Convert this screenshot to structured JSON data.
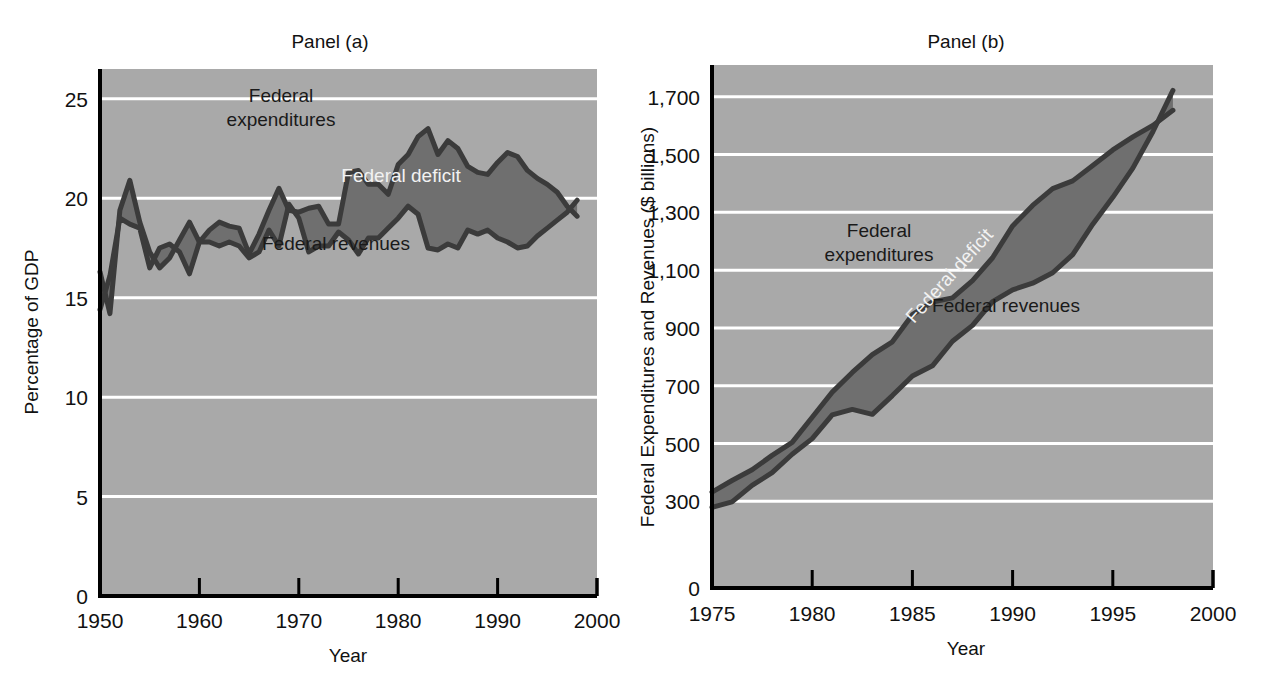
{
  "figure": {
    "background_color": "#ffffff",
    "plot_background_color": "#a9a9a9",
    "gridline_color": "#ffffff",
    "deficit_fill_color": "#6f6f6f",
    "line_color": "#3b3b3b"
  },
  "chart_data": [
    {
      "id": "panel_a",
      "type": "area",
      "title": "Panel (a)",
      "xlabel": "Year",
      "ylabel": "Percentage of GDP",
      "xlim": [
        1950,
        2000
      ],
      "ylim": [
        0,
        26.5
      ],
      "xticks": [
        1950,
        1960,
        1970,
        1980,
        1990,
        2000
      ],
      "xtick_labels": [
        "1950",
        "1960",
        "1970",
        "1980",
        "1990",
        "2000"
      ],
      "yticks": [
        0,
        5,
        10,
        15,
        20,
        25
      ],
      "ytick_labels": [
        "0",
        "5",
        "10",
        "15",
        "20",
        "25"
      ],
      "grid": true,
      "grid_axis": "y",
      "legend": "inline-annotations",
      "annotations": [
        {
          "text": "Federal expenditures",
          "lines": [
            "Federal",
            "expenditures"
          ],
          "color": "#1a1a1a",
          "x_px": 281,
          "y_px": 102
        },
        {
          "text": "Federal deficit",
          "lines": [
            "Federal deficit"
          ],
          "color": "#f2f2f2",
          "x_px": 401,
          "y_px": 182
        },
        {
          "text": "Federal revenues",
          "lines": [
            "Federal revenues"
          ],
          "color": "#1a1a1a",
          "x_px": 336,
          "y_px": 250
        }
      ],
      "x": [
        1950,
        1951,
        1952,
        1953,
        1954,
        1955,
        1956,
        1957,
        1958,
        1959,
        1960,
        1961,
        1962,
        1963,
        1964,
        1965,
        1966,
        1967,
        1968,
        1969,
        1970,
        1971,
        1972,
        1973,
        1974,
        1975,
        1976,
        1977,
        1978,
        1979,
        1980,
        1981,
        1982,
        1983,
        1984,
        1985,
        1986,
        1987,
        1988,
        1989,
        1990,
        1991,
        1992,
        1993,
        1994,
        1995,
        1996,
        1997,
        1998
      ],
      "series": [
        {
          "name": "Federal expenditures",
          "values": [
            16.3,
            14.2,
            19.4,
            20.9,
            18.8,
            17.3,
            16.5,
            17.0,
            17.9,
            18.8,
            17.8,
            18.4,
            18.8,
            18.6,
            18.5,
            17.2,
            18.2,
            19.4,
            20.5,
            19.4,
            19.3,
            19.5,
            19.6,
            18.7,
            18.7,
            21.3,
            21.4,
            20.7,
            20.7,
            20.2,
            21.7,
            22.2,
            23.1,
            23.5,
            22.2,
            22.9,
            22.5,
            21.6,
            21.3,
            21.2,
            21.8,
            22.3,
            22.1,
            21.4,
            21.0,
            20.7,
            20.3,
            19.6,
            19.1
          ],
          "color": "#3b3b3b"
        },
        {
          "name": "Federal revenues",
          "values": [
            14.4,
            16.1,
            19.0,
            18.7,
            18.5,
            16.5,
            17.5,
            17.7,
            17.3,
            16.2,
            17.8,
            17.8,
            17.6,
            17.8,
            17.6,
            17.0,
            17.3,
            18.4,
            17.6,
            19.7,
            19.0,
            17.3,
            17.6,
            17.6,
            18.3,
            17.9,
            17.2,
            18.0,
            18.0,
            18.5,
            19.0,
            19.6,
            19.2,
            17.5,
            17.4,
            17.7,
            17.5,
            18.4,
            18.2,
            18.4,
            18.0,
            17.8,
            17.5,
            17.6,
            18.1,
            18.5,
            18.9,
            19.3,
            19.9
          ],
          "color": "#3b3b3b"
        }
      ]
    },
    {
      "id": "panel_b",
      "type": "area",
      "title": "Panel (b)",
      "xlabel": "Year",
      "ylabel": "Federal Expenditures and Revenues ($ billions)",
      "xlim": [
        1975,
        2000
      ],
      "ylim": [
        0,
        1810
      ],
      "xticks": [
        1975,
        1980,
        1985,
        1990,
        1995,
        2000
      ],
      "xtick_labels": [
        "1975",
        "1980",
        "1985",
        "1990",
        "1995",
        "2000"
      ],
      "yticks": [
        0,
        300,
        500,
        700,
        900,
        1100,
        1300,
        1500,
        1700
      ],
      "ytick_labels": [
        "0",
        "300",
        "500",
        "700",
        "900",
        "1,100",
        "1,300",
        "1,500",
        "1,700"
      ],
      "grid": true,
      "grid_axis": "y",
      "legend": "inline-annotations",
      "annotations": [
        {
          "text": "Federal expenditures",
          "lines": [
            "Federal",
            "expenditures"
          ],
          "color": "#1a1a1a",
          "x_px": 243,
          "y_px": 237,
          "rotation": 0
        },
        {
          "text": "Federal deficit",
          "lines": [
            "Federal deficit"
          ],
          "color": "#f2f2f2",
          "x_px": 318,
          "y_px": 280,
          "rotation": -48
        },
        {
          "text": "Federal revenues",
          "lines": [
            "Federal revenues"
          ],
          "color": "#1a1a1a",
          "x_px": 370,
          "y_px": 312,
          "rotation": 0
        }
      ],
      "x": [
        1975,
        1976,
        1977,
        1978,
        1979,
        1980,
        1981,
        1982,
        1983,
        1984,
        1985,
        1986,
        1987,
        1988,
        1989,
        1990,
        1991,
        1992,
        1993,
        1994,
        1995,
        1996,
        1997,
        1998
      ],
      "series": [
        {
          "name": "Federal expenditures",
          "values": [
            332,
            372,
            409,
            459,
            504,
            591,
            678,
            746,
            808,
            852,
            946,
            990,
            1004,
            1064,
            1143,
            1253,
            1324,
            1382,
            1409,
            1462,
            1516,
            1561,
            1601,
            1653
          ],
          "color": "#3b3b3b"
        },
        {
          "name": "Federal revenues",
          "values": [
            279,
            298,
            355,
            399,
            463,
            517,
            599,
            618,
            601,
            666,
            734,
            769,
            854,
            909,
            991,
            1032,
            1055,
            1091,
            1154,
            1259,
            1352,
            1453,
            1579,
            1722
          ],
          "color": "#3b3b3b"
        }
      ]
    }
  ]
}
